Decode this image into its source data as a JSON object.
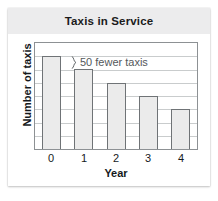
{
  "card": {
    "title": "Taxis in Service"
  },
  "chart_data": {
    "type": "bar",
    "title": "Taxis in Service",
    "xlabel": "Year",
    "ylabel": "Number of taxis",
    "categories": [
      "0",
      "1",
      "2",
      "3",
      "4"
    ],
    "values": [
      7,
      6,
      5,
      4,
      3
    ],
    "ylim": [
      0,
      8
    ],
    "y_gridline_count": 7,
    "grid": true,
    "legend": false,
    "annotations": [
      {
        "name": "fifty-fewer-taxis",
        "text": "50 fewer taxis",
        "marker": "brace",
        "spans_categories": [
          "0",
          "1"
        ],
        "color": "#54585b"
      }
    ],
    "colors": {
      "bar_fill": "#ebebeb",
      "bar_border": "#6f7376",
      "gridline": "#c9cccd",
      "plot_border": "#8d9194",
      "title_band": "#ececed",
      "text": "#15191c"
    }
  }
}
